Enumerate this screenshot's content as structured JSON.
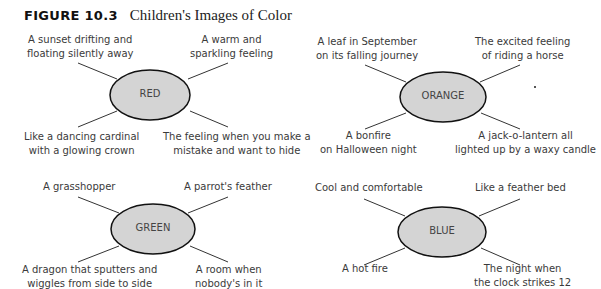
{
  "figure": {
    "number": "FIGURE 10.3",
    "caption": "Children's Images of Color"
  },
  "colors": {
    "ellipse_fill": "#d4d4d4",
    "ellipse_stroke": "#111111",
    "line": "#333333",
    "text": "#3a3a3a"
  },
  "clusters": [
    {
      "name": "RED",
      "top_left": [
        "A sunset drifting and",
        "floating silently away"
      ],
      "top_right": [
        "A warm and",
        "sparkling feeling"
      ],
      "bottom_left": [
        "Like a dancing cardinal",
        "with a glowing crown"
      ],
      "bottom_right": [
        "The feeling when you make a",
        "mistake and want to hide"
      ]
    },
    {
      "name": "ORANGE",
      "top_left": [
        "A leaf in September",
        "on its falling journey"
      ],
      "top_right": [
        "The excited feeling",
        "of riding a horse"
      ],
      "bottom_left": [
        "A bonfire",
        "on Halloween night"
      ],
      "bottom_right": [
        "A jack-o-lantern all",
        "lighted up by a waxy candle"
      ]
    },
    {
      "name": "GREEN",
      "top_left": [
        "A grasshopper"
      ],
      "top_right": [
        "A parrot's feather"
      ],
      "bottom_left": [
        "A dragon that sputters and",
        "wiggles from side to side"
      ],
      "bottom_right": [
        "A room when",
        "nobody's in it"
      ]
    },
    {
      "name": "BLUE",
      "top_left": [
        "Cool and comfortable"
      ],
      "top_right": [
        "Like a feather bed"
      ],
      "bottom_left": [
        "A hot fire"
      ],
      "bottom_right": [
        "The night when",
        "the clock strikes 12"
      ]
    }
  ]
}
